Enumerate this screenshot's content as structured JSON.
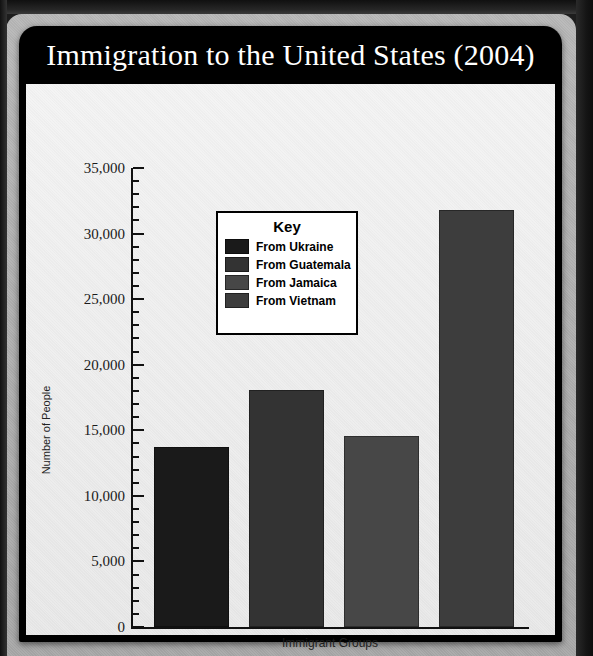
{
  "document": {
    "title": "Immigration to the United States (2004)"
  },
  "chart_data": {
    "type": "bar",
    "title": "Immigration to the United States (2004)",
    "xlabel": "Immigrant Groups",
    "ylabel": "Number of People",
    "ylim": [
      0,
      35000
    ],
    "ytick_step": 5000,
    "yminor_step": 1000,
    "grid": false,
    "legend_position": "inside-upper-center",
    "legend_title": "Key",
    "categories": [
      "From Ukraine",
      "From Guatemala",
      "From Jamaica",
      "From Vietnam"
    ],
    "values": [
      13700,
      18100,
      14600,
      31800
    ],
    "colors": [
      "#1a1a1a",
      "#333333",
      "#474747",
      "#3d3d3d"
    ],
    "ytick_labels": [
      "35,000",
      "30,000",
      "25,000",
      "20,000",
      "15,000",
      "10,000",
      "5,000",
      "0"
    ],
    "ytick_values": [
      35000,
      30000,
      25000,
      20000,
      15000,
      10000,
      5000,
      0
    ]
  },
  "legend": {
    "title": "Key",
    "items": [
      {
        "label": "From Ukraine",
        "color": "#1a1a1a"
      },
      {
        "label": "From Guatemala",
        "color": "#333333"
      },
      {
        "label": "From Jamaica",
        "color": "#474747"
      },
      {
        "label": "From Vietnam",
        "color": "#3d3d3d"
      }
    ]
  },
  "theme": {
    "card_background": "#000000",
    "canvas_background": "#f0f0f0",
    "page_background": "#b2b2b2",
    "axis_color": "#111111",
    "title_color": "#ffffff"
  }
}
